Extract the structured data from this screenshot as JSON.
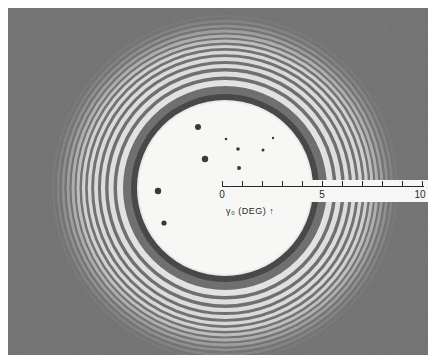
{
  "figure": {
    "colors": {
      "background": "#6e6e6e",
      "fringe_bright": "#f4f4f2",
      "fringe_dark": "#3a3a3a",
      "border": "#ffffff"
    }
  },
  "scale_bar": {
    "ticks": [
      0,
      1,
      2,
      3,
      4,
      5,
      6,
      7,
      8,
      9,
      10
    ],
    "labels": {
      "start": "0",
      "mid": "5",
      "end": "10"
    },
    "axis_label": "γ₀ (DEG) ↑"
  }
}
